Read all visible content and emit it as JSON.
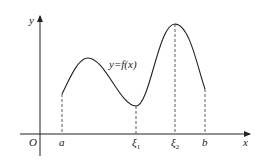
{
  "diagram": {
    "type": "function-graph",
    "curve_label": "y=f(x)",
    "axes": {
      "x_label": "x",
      "y_label": "y",
      "origin_label": "O"
    },
    "x_marks": [
      {
        "label": "a",
        "sub": ""
      },
      {
        "label": "ξ",
        "sub": "1"
      },
      {
        "label": "ξ",
        "sub": "2"
      },
      {
        "label": "b",
        "sub": ""
      }
    ],
    "colors": {
      "curve": "#222222",
      "axis": "#222222",
      "dashed": "#333333"
    }
  }
}
